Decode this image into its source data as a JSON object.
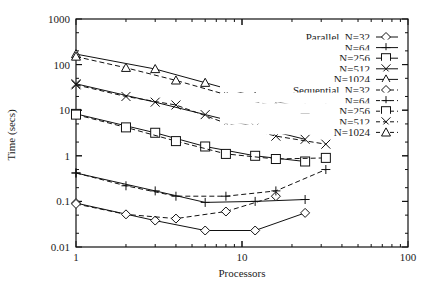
{
  "chart_data": {
    "type": "line",
    "title": "",
    "xlabel": "Processors",
    "ylabel": "Time (secs)",
    "xscale": "log",
    "yscale": "log",
    "xlim": [
      1,
      100
    ],
    "ylim": [
      0.01,
      1000
    ],
    "x_ticks": [
      "1",
      "10",
      "100"
    ],
    "y_ticks": [
      "0.01",
      "0.1",
      "1",
      "10",
      "100",
      "1000"
    ],
    "grid": false,
    "legend_position": "upper right",
    "series": [
      {
        "name": "Parallel, N=32",
        "label": "Parallel, N=32",
        "marker": "diamond",
        "dash": "solid",
        "x": [
          1,
          3,
          6,
          12,
          24
        ],
        "values": [
          0.092,
          0.038,
          0.023,
          0.023,
          0.056
        ]
      },
      {
        "name": "Parallel, N=64",
        "label": "N=64",
        "marker": "plus",
        "dash": "solid",
        "x": [
          1,
          3,
          6,
          12,
          24
        ],
        "values": [
          0.42,
          0.17,
          0.095,
          0.1,
          0.11
        ]
      },
      {
        "name": "Parallel, N=256",
        "label": "N=256",
        "marker": "square",
        "dash": "solid",
        "x": [
          1,
          3,
          6,
          12,
          24
        ],
        "values": [
          8.3,
          3.2,
          1.6,
          1.0,
          0.75
        ]
      },
      {
        "name": "Parallel, N=512",
        "label": "N=512",
        "marker": "cross",
        "dash": "solid",
        "x": [
          1,
          3,
          6,
          12,
          24
        ],
        "values": [
          38,
          15,
          8.0,
          4.3,
          2.3
        ]
      },
      {
        "name": "Parallel, N=1024",
        "label": "N=1024",
        "marker": "triangle",
        "dash": "solid",
        "x": [
          1,
          3,
          6,
          12,
          24
        ],
        "values": [
          170,
          80,
          40,
          20,
          11
        ]
      },
      {
        "name": "Sequential, N=32",
        "label": "Sequential, N=32",
        "marker": "diamond",
        "dash": "dashed",
        "x": [
          1,
          2,
          4,
          8,
          16
        ],
        "values": [
          0.088,
          0.052,
          0.042,
          0.06,
          0.13
        ]
      },
      {
        "name": "Sequential, N=64",
        "label": "N=64",
        "marker": "plus",
        "dash": "dashed",
        "x": [
          1,
          2,
          4,
          8,
          16,
          32
        ],
        "values": [
          0.42,
          0.22,
          0.13,
          0.13,
          0.17,
          0.5
        ]
      },
      {
        "name": "Sequential, N=256",
        "label": "N=256",
        "marker": "square",
        "dash": "dashed",
        "x": [
          1,
          2,
          4,
          8,
          16,
          32
        ],
        "values": [
          8.0,
          4.2,
          2.1,
          1.1,
          0.85,
          0.9
        ]
      },
      {
        "name": "Sequential, N=512",
        "label": "N=512",
        "marker": "cross",
        "dash": "dashed",
        "x": [
          1,
          2,
          4,
          8,
          16,
          32
        ],
        "values": [
          36,
          20,
          13,
          5.2,
          2.7,
          1.8
        ]
      },
      {
        "name": "Sequential, N=1024",
        "label": "N=1024",
        "marker": "triangle",
        "dash": "dashed",
        "x": [
          1,
          2,
          4,
          8,
          16,
          24,
          32
        ],
        "values": [
          150,
          85,
          45,
          22,
          12,
          10.5,
          11
        ]
      }
    ]
  }
}
